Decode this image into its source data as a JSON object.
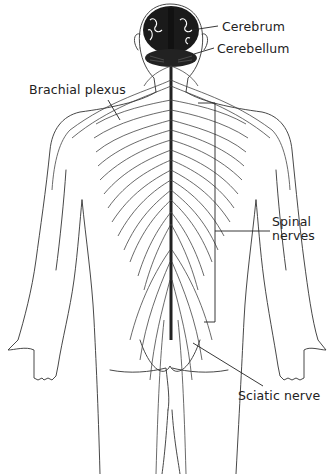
{
  "diagram": {
    "labels": {
      "cerebrum": "Cerebrum",
      "cerebellum": "Cerebellum",
      "brachial_plexus": "Brachial plexus",
      "spinal_nerves_line1": "Spinal",
      "spinal_nerves_line2": "nerves",
      "sciatic_nerve": "Sciatic nerve"
    },
    "colors": {
      "ink": "#222222",
      "brain": "#1a1a1a",
      "background": "#ffffff"
    }
  }
}
